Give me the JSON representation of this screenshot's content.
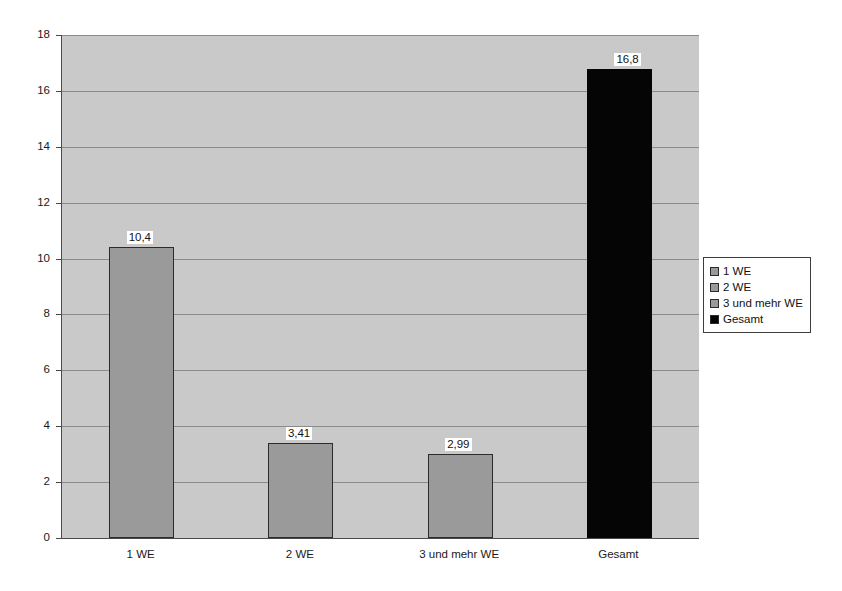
{
  "chart_data": {
    "type": "bar",
    "title": "",
    "subtitle": "",
    "xlabel": "",
    "ylabel": "",
    "categories": [
      "1 WE",
      "2 WE",
      "3 und mehr WE",
      "Gesamt"
    ],
    "values": [
      10.4,
      3.41,
      2.99,
      16.8
    ],
    "data_labels": [
      "10,4",
      "3,41",
      "2,99",
      "16,8"
    ],
    "series": [
      {
        "name": "Werte",
        "values": [
          10.4,
          3.41,
          2.99,
          16.8
        ]
      }
    ],
    "ylim": [
      0,
      18
    ],
    "yticks": [
      0,
      2,
      4,
      6,
      8,
      10,
      12,
      14,
      16,
      18
    ],
    "ytick_labels": [
      "0",
      "2",
      "4",
      "6",
      "8",
      "10",
      "12",
      "14",
      "16",
      "18"
    ],
    "grid": true,
    "grid_axis": "y",
    "legend_position": "right",
    "legend": [
      {
        "label": "1 WE",
        "color": "#9a9a9a"
      },
      {
        "label": "2 WE",
        "color": "#9a9a9a"
      },
      {
        "label": "3 und mehr WE",
        "color": "#9a9a9a"
      },
      {
        "label": "Gesamt",
        "color": "#050505"
      }
    ],
    "bar_colors": [
      "#9a9a9a",
      "#9a9a9a",
      "#9a9a9a",
      "#050505"
    ],
    "plot_background": "#c9c9c9",
    "page_background": "#ffffff",
    "axis_color": "#4a4a4a",
    "gridline_color": "#8b8b8b"
  }
}
